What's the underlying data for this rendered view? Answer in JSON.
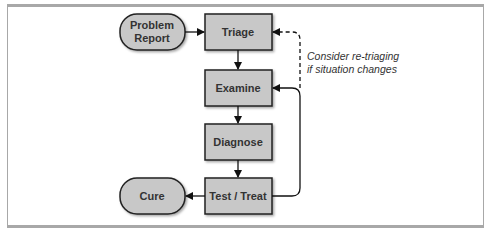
{
  "diagram": {
    "nodes": {
      "problem_report": {
        "line1": "Problem",
        "line2": "Report",
        "shape": "rounded"
      },
      "triage": {
        "label": "Triage",
        "shape": "box"
      },
      "examine": {
        "label": "Examine",
        "shape": "box"
      },
      "diagnose": {
        "label": "Diagnose",
        "shape": "box"
      },
      "test_treat": {
        "label": "Test / Treat",
        "shape": "box"
      },
      "cure": {
        "label": "Cure",
        "shape": "rounded"
      }
    },
    "annotation": {
      "line1": "Consider re-triaging",
      "line2": "if situation changes"
    },
    "colors": {
      "node_fill": "#c8c8c8",
      "node_stroke": "#222222",
      "frame": "#a8a8a8"
    }
  }
}
